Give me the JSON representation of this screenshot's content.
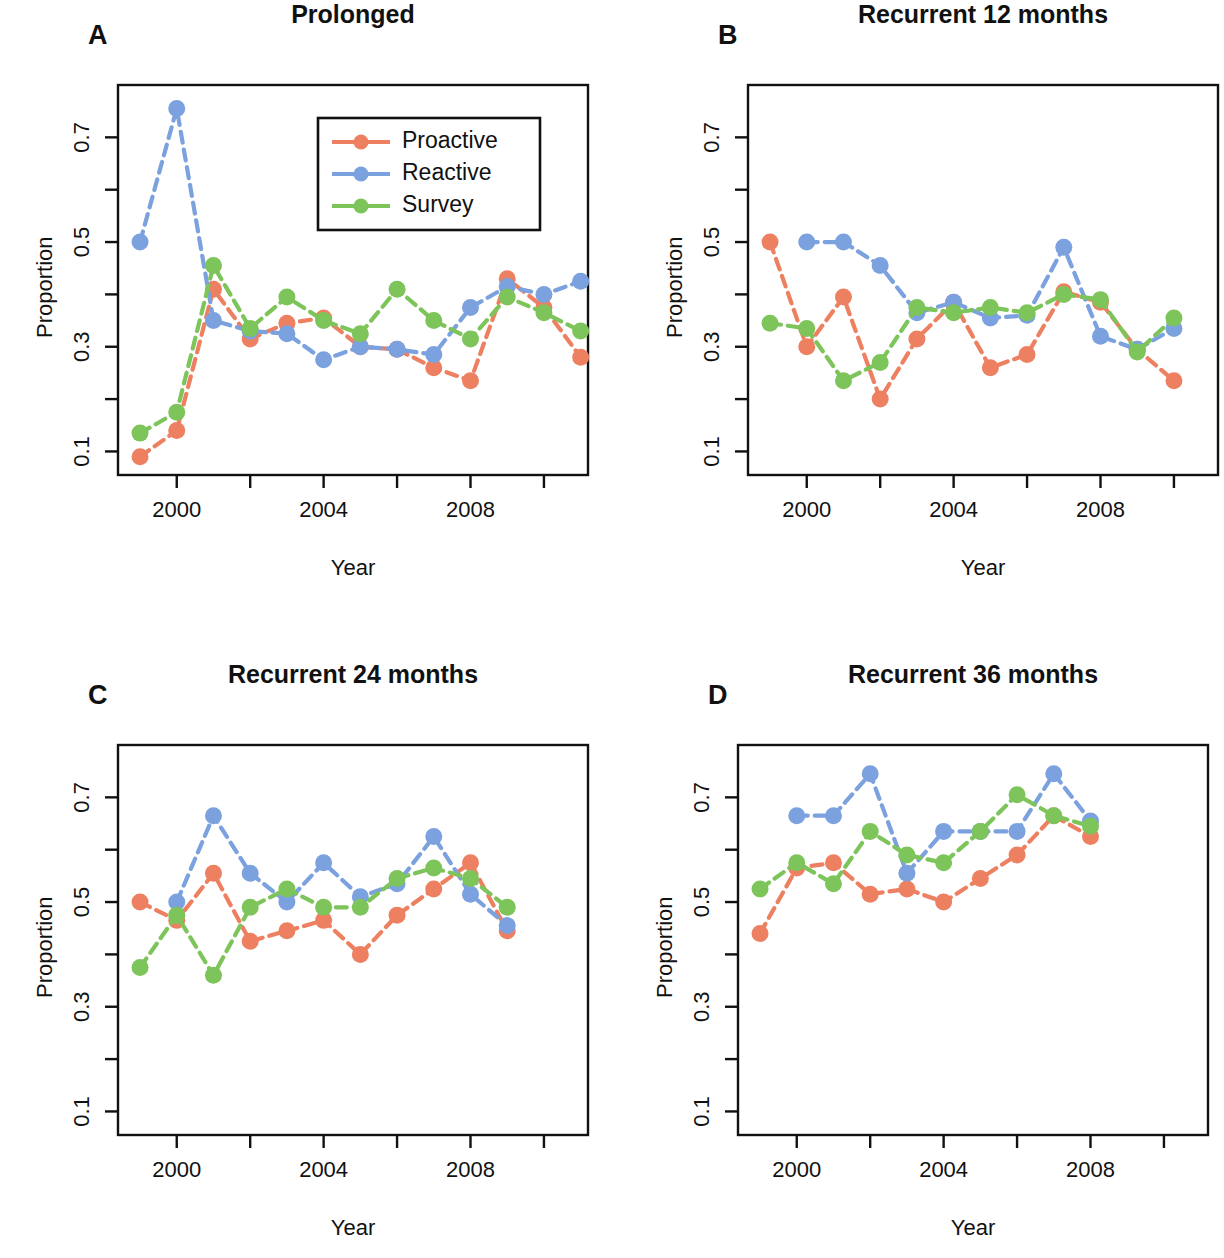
{
  "figure": {
    "axis_label_x": "Year",
    "axis_label_y": "Proportion",
    "colors": {
      "proactive": "#EE8062",
      "reactive": "#7BA1DE",
      "survey": "#7DC45A",
      "axis": "#111111",
      "background": "#FFFFFF"
    }
  },
  "legend": {
    "position": "top-right-of-panel-A",
    "entries": [
      {
        "label": "Proactive",
        "color": "#EE8062"
      },
      {
        "label": "Reactive",
        "color": "#7BA1DE"
      },
      {
        "label": "Survey",
        "color": "#7DC45A"
      }
    ]
  },
  "panels": [
    {
      "letter": "A",
      "title": "Prolonged"
    },
    {
      "letter": "B",
      "title": "Recurrent 12 months"
    },
    {
      "letter": "C",
      "title": "Recurrent 24 months"
    },
    {
      "letter": "D",
      "title": "Recurrent 36 months"
    }
  ],
  "chart_data": [
    {
      "type": "line",
      "panel": "A",
      "title": "Prolonged",
      "xlabel": "Year",
      "ylabel": "Proportion",
      "xlim": [
        1998.4,
        2011.2
      ],
      "ylim": [
        0.055,
        0.8
      ],
      "grid": false,
      "legend": "top-right",
      "xticks": [
        2000,
        2002,
        2004,
        2006,
        2008,
        2010
      ],
      "xticklabels": [
        "2000",
        "",
        "2004",
        "",
        "2008",
        ""
      ],
      "yticks": [
        0.1,
        0.2,
        0.3,
        0.4,
        0.5,
        0.6,
        0.7
      ],
      "yticklabels": [
        "0.1",
        "",
        "0.3",
        "",
        "0.5",
        "",
        "0.7"
      ],
      "x": [
        1999,
        2000,
        2001,
        2002,
        2003,
        2004,
        2005,
        2006,
        2007,
        2008,
        2009,
        2010,
        2011
      ],
      "series": [
        {
          "name": "Proactive",
          "color": "#EE8062",
          "values": [
            0.09,
            0.14,
            0.41,
            0.315,
            0.345,
            0.355,
            0.3,
            0.295,
            0.26,
            0.235,
            0.43,
            0.375,
            0.28
          ]
        },
        {
          "name": "Reactive",
          "color": "#7BA1DE",
          "values": [
            0.5,
            0.755,
            0.35,
            0.33,
            0.325,
            0.275,
            0.3,
            0.295,
            0.285,
            0.375,
            0.415,
            0.4,
            0.425
          ]
        },
        {
          "name": "Survey",
          "color": "#7DC45A",
          "values": [
            0.135,
            0.175,
            0.455,
            0.335,
            0.395,
            0.35,
            0.325,
            0.41,
            0.35,
            0.315,
            0.395,
            0.365,
            0.33
          ]
        }
      ],
      "series_notes": "Reactive has no value at x=1999 start segment shown from 2000"
    },
    {
      "type": "line",
      "panel": "B",
      "title": "Recurrent 12 months",
      "xlabel": "Year",
      "ylabel": "Proportion",
      "xlim": [
        1998.4,
        2011.2
      ],
      "ylim": [
        0.055,
        0.8
      ],
      "grid": false,
      "legend": "none",
      "xticks": [
        2000,
        2002,
        2004,
        2006,
        2008,
        2010
      ],
      "xticklabels": [
        "2000",
        "",
        "2004",
        "",
        "2008",
        ""
      ],
      "yticks": [
        0.1,
        0.2,
        0.3,
        0.4,
        0.5,
        0.6,
        0.7
      ],
      "yticklabels": [
        "0.1",
        "",
        "0.3",
        "",
        "0.5",
        "",
        "0.7"
      ],
      "x": [
        1999,
        2000,
        2001,
        2002,
        2003,
        2004,
        2005,
        2006,
        2007,
        2008,
        2009,
        2010
      ],
      "series": [
        {
          "name": "Proactive",
          "color": "#EE8062",
          "values": [
            0.5,
            0.3,
            0.395,
            0.2,
            0.315,
            0.385,
            0.26,
            0.285,
            0.405,
            0.385,
            0.295,
            0.235
          ]
        },
        {
          "name": "Reactive",
          "color": "#7BA1DE",
          "values": [
            null,
            0.5,
            0.5,
            0.455,
            0.365,
            0.385,
            0.355,
            0.36,
            0.49,
            0.32,
            0.295,
            0.335
          ]
        },
        {
          "name": "Survey",
          "color": "#7DC45A",
          "values": [
            0.345,
            0.335,
            0.235,
            0.27,
            0.375,
            0.365,
            0.375,
            0.365,
            0.4,
            0.39,
            0.29,
            0.355
          ]
        }
      ]
    },
    {
      "type": "line",
      "panel": "C",
      "title": "Recurrent 24 months",
      "xlabel": "Year",
      "ylabel": "Proportion",
      "xlim": [
        1998.4,
        2011.2
      ],
      "ylim": [
        0.055,
        0.8
      ],
      "grid": false,
      "legend": "none",
      "xticks": [
        2000,
        2002,
        2004,
        2006,
        2008,
        2010
      ],
      "xticklabels": [
        "2000",
        "",
        "2004",
        "",
        "2008",
        ""
      ],
      "yticks": [
        0.1,
        0.2,
        0.3,
        0.4,
        0.5,
        0.6,
        0.7
      ],
      "yticklabels": [
        "0.1",
        "",
        "0.3",
        "",
        "0.5",
        "",
        "0.7"
      ],
      "x": [
        1999,
        2000,
        2001,
        2002,
        2003,
        2004,
        2005,
        2006,
        2007,
        2008,
        2009
      ],
      "series": [
        {
          "name": "Proactive",
          "color": "#EE8062",
          "values": [
            0.5,
            0.465,
            0.555,
            0.425,
            0.445,
            0.465,
            0.4,
            0.475,
            0.525,
            0.575,
            0.445
          ]
        },
        {
          "name": "Reactive",
          "color": "#7BA1DE",
          "values": [
            null,
            0.5,
            0.665,
            0.555,
            0.5,
            0.575,
            0.51,
            0.535,
            0.625,
            0.515,
            0.455
          ]
        },
        {
          "name": "Survey",
          "color": "#7DC45A",
          "values": [
            0.375,
            0.475,
            0.36,
            0.49,
            0.525,
            0.49,
            0.49,
            0.545,
            0.565,
            0.545,
            0.49
          ]
        }
      ]
    },
    {
      "type": "line",
      "panel": "D",
      "title": "Recurrent 36 months",
      "xlabel": "Year",
      "ylabel": "Proportion",
      "xlim": [
        1998.4,
        2011.2
      ],
      "ylim": [
        0.055,
        0.8
      ],
      "grid": false,
      "legend": "none",
      "xticks": [
        2000,
        2002,
        2004,
        2006,
        2008,
        2010
      ],
      "xticklabels": [
        "2000",
        "",
        "2004",
        "",
        "2008",
        ""
      ],
      "yticks": [
        0.1,
        0.2,
        0.3,
        0.4,
        0.5,
        0.6,
        0.7
      ],
      "yticklabels": [
        "0.1",
        "",
        "0.3",
        "",
        "0.5",
        "",
        "0.7"
      ],
      "x": [
        1999,
        2000,
        2001,
        2002,
        2003,
        2004,
        2005,
        2006,
        2007,
        2008
      ],
      "series": [
        {
          "name": "Proactive",
          "color": "#EE8062",
          "values": [
            0.44,
            0.565,
            0.575,
            0.515,
            0.525,
            0.5,
            0.545,
            0.59,
            0.665,
            0.625
          ]
        },
        {
          "name": "Reactive",
          "color": "#7BA1DE",
          "values": [
            null,
            0.665,
            0.665,
            0.745,
            0.555,
            0.635,
            0.635,
            0.635,
            0.745,
            0.655
          ]
        },
        {
          "name": "Survey",
          "color": "#7DC45A",
          "values": [
            0.525,
            0.575,
            0.535,
            0.635,
            0.59,
            0.575,
            0.635,
            0.705,
            0.665,
            0.645
          ]
        }
      ]
    }
  ]
}
